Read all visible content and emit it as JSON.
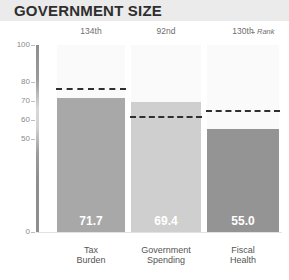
{
  "header": {
    "title": "GOVERNMENT SIZE"
  },
  "legend": {
    "rank_label": "Rank"
  },
  "chart_data": {
    "type": "bar",
    "title": "GOVERNMENT SIZE",
    "categories": [
      "Tax Burden",
      "Government Spending",
      "Fiscal Health"
    ],
    "category_lines": [
      [
        "Tax",
        "Burden"
      ],
      [
        "Government",
        "Spending"
      ],
      [
        "Fiscal",
        "Health"
      ]
    ],
    "values": [
      71.7,
      69.4,
      55.0
    ],
    "value_labels": [
      "71.7",
      "69.4",
      "55.0"
    ],
    "ranks": [
      "134th",
      "92nd",
      "130th"
    ],
    "reference_values": [
      77.0,
      62.0,
      65.0
    ],
    "reference_label": "Rank",
    "bar_colors": [
      "#a8a8a8",
      "#cfcfcf",
      "#949494"
    ],
    "ylim": [
      0,
      100
    ],
    "yticks": [
      100,
      80,
      70,
      60,
      50,
      0
    ],
    "ytick_labels": [
      "100",
      "80",
      "70",
      "60",
      "50",
      "0"
    ],
    "xlabel": "",
    "ylabel": "",
    "grid": false,
    "legend_position": "top-right"
  }
}
